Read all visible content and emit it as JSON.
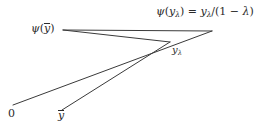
{
  "figure": {
    "background_color": "#ffffff",
    "stroke_color": "#3a3a3a",
    "text_color": "#2b2b2b",
    "labels": {
      "psi_y_lambda_formula": {
        "psi": "ψ",
        "open": "(",
        "y": "y",
        "lambda_sub": "λ",
        "close": ")",
        "equals": "=",
        "numerator_y": "y",
        "numerator_sub": "λ",
        "slash": "/(1 − ",
        "lambda_end": "λ",
        "paren_end": ")"
      },
      "psi_ybar": {
        "psi": "ψ",
        "open": "(",
        "ybar": "y",
        "close": ")"
      },
      "y_lambda_point": {
        "y": "y",
        "lambda_sub": "λ"
      },
      "origin": "0",
      "ybar_axis": "y"
    }
  },
  "geometry": {
    "points": {
      "psi_ybar_vertex": [
        63,
        30
      ],
      "apex": [
        212,
        31
      ],
      "y_lambda_vertex": [
        170,
        42
      ],
      "origin_point": [
        13,
        105
      ],
      "ybar_point": [
        62,
        110
      ]
    },
    "segments": [
      {
        "name": "psi-ybar-to-apex",
        "from": [
          63,
          30
        ],
        "to": [
          212,
          31
        ]
      },
      {
        "name": "psi-ybar-to-y-lambda",
        "from": [
          63,
          30
        ],
        "to": [
          170,
          42
        ]
      },
      {
        "name": "origin-to-apex",
        "from": [
          13,
          105
        ],
        "to": [
          212,
          31
        ]
      },
      {
        "name": "ybar-to-y-lambda",
        "from": [
          62,
          110
        ],
        "to": [
          170,
          42
        ]
      }
    ]
  }
}
